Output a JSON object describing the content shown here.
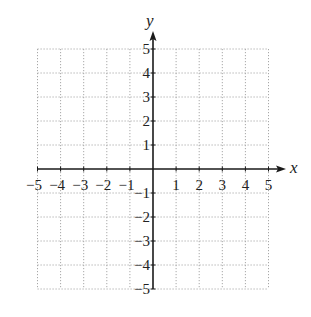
{
  "figure": {
    "type": "coordinate-plane",
    "x_axis": {
      "label": "x",
      "min": -5,
      "max": 5,
      "tick_labels": [
        "−5",
        "−4",
        "−3",
        "−2",
        "−1",
        "1",
        "2",
        "3",
        "4",
        "5"
      ],
      "tick_values": [
        -5,
        -4,
        -3,
        -2,
        -1,
        1,
        2,
        3,
        4,
        5
      ]
    },
    "y_axis": {
      "label": "y",
      "min": -5,
      "max": 5,
      "tick_labels": [
        "5",
        "4",
        "3",
        "2",
        "1",
        "−1",
        "−2",
        "−3",
        "−4",
        "−5"
      ],
      "tick_values": [
        5,
        4,
        3,
        2,
        1,
        -1,
        -2,
        -3,
        -4,
        -5
      ]
    },
    "grid": {
      "style": "dotted",
      "step": 1,
      "color": "#a8a8a8"
    },
    "axis_color": "#1a1a1a"
  }
}
